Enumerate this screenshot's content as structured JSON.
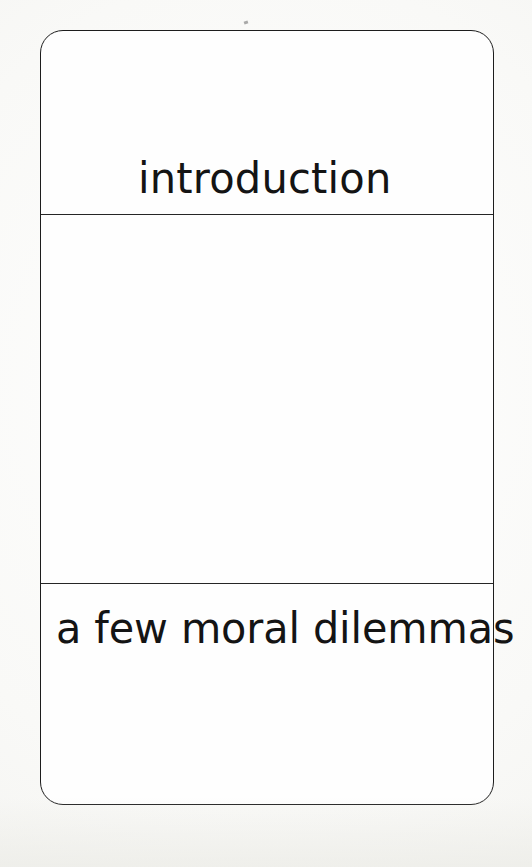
{
  "page": {
    "kind": "book-part-divider-page",
    "background_color": "#f8f8f6",
    "ink_color": "#141414"
  },
  "frame": {
    "border_color": "#1d1d1d",
    "fill_color": "#fefefe",
    "corner_radius_px": 23,
    "rule_color": "#262626"
  },
  "bands": {
    "top": {
      "title": "introduction"
    },
    "middle": {
      "content": ""
    },
    "bottom": {
      "subtitle": "a few moral dilemmas"
    }
  }
}
